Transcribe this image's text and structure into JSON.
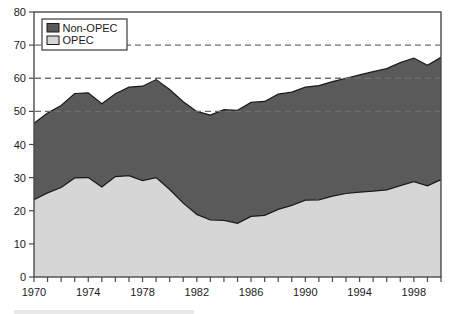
{
  "chart_data": {
    "type": "area",
    "title": "",
    "subtitle": "",
    "xlabel": "",
    "ylabel": "",
    "stacked": true,
    "grid": false,
    "legend_position": "top-left-inside",
    "xlim": [
      1970,
      2000
    ],
    "ylim": [
      0,
      80
    ],
    "yticks": [
      0,
      10,
      20,
      30,
      40,
      50,
      60,
      70,
      80
    ],
    "ytick_labels": [
      "0",
      "10",
      "20",
      "30",
      "40",
      "50",
      "60",
      "70",
      "80"
    ],
    "xticks": [
      1970,
      1971,
      1972,
      1973,
      1974,
      1975,
      1976,
      1977,
      1978,
      1979,
      1980,
      1981,
      1982,
      1983,
      1984,
      1985,
      1986,
      1987,
      1988,
      1989,
      1990,
      1991,
      1992,
      1993,
      1994,
      1995,
      1996,
      1997,
      1998,
      1999,
      2000
    ],
    "xtick_labels_shown": [
      "1970",
      "1974",
      "1978",
      "1982",
      "1986",
      "1990",
      "1994",
      "1998"
    ],
    "xtick_labels_shown_values": [
      1970,
      1974,
      1978,
      1982,
      1986,
      1990,
      1994,
      1998
    ],
    "x": [
      1970,
      1971,
      1972,
      1973,
      1974,
      1975,
      1976,
      1977,
      1978,
      1979,
      1980,
      1981,
      1982,
      1983,
      1984,
      1985,
      1986,
      1987,
      1988,
      1989,
      1990,
      1991,
      1992,
      1993,
      1994,
      1995,
      1996,
      1997,
      1998,
      1999,
      2000
    ],
    "series": [
      {
        "name": "OPEC",
        "color": "#d6d6d6",
        "values": [
          23.3,
          25.4,
          27.0,
          29.9,
          30.0,
          27.2,
          30.3,
          30.6,
          29.1,
          30.0,
          26.4,
          22.3,
          18.9,
          17.2,
          17.1,
          16.2,
          18.3,
          18.6,
          20.4,
          21.6,
          23.2,
          23.3,
          24.4,
          25.2,
          25.6,
          25.9,
          26.3,
          27.6,
          28.8,
          27.5,
          29.4
        ]
      },
      {
        "name": "Non-OPEC",
        "color": "#5a5a5a",
        "values": [
          23.1,
          24.1,
          24.8,
          25.5,
          25.6,
          25.1,
          25.0,
          26.7,
          28.5,
          29.6,
          30.2,
          30.6,
          31.1,
          31.7,
          33.4,
          34.1,
          34.4,
          34.4,
          34.8,
          34.2,
          34.1,
          34.5,
          34.6,
          34.8,
          35.4,
          36.1,
          36.6,
          37.1,
          37.3,
          36.4,
          36.9
        ]
      }
    ],
    "totals": [
      46.4,
      49.5,
      51.8,
      55.4,
      55.6,
      52.3,
      55.3,
      57.3,
      57.6,
      59.6,
      56.6,
      52.9,
      50.0,
      48.9,
      50.5,
      50.3,
      52.7,
      53.0,
      55.2,
      55.8,
      57.3,
      57.8,
      59.0,
      60.0,
      61.0,
      62.0,
      62.9,
      64.7,
      66.1,
      63.9,
      66.3
    ],
    "reference_lines": [
      {
        "value": 70,
        "style": "dashed",
        "color": "#6e6e6e"
      },
      {
        "value": 60,
        "style": "dashed",
        "color": "#6e6e6e"
      },
      {
        "value": 50,
        "style": "dashed",
        "color": "#6e6e6e"
      }
    ],
    "legend": [
      {
        "label": "Non-OPEC",
        "color": "#5a5a5a"
      },
      {
        "label": "OPEC",
        "color": "#d6d6d6"
      }
    ]
  },
  "axes": {
    "ytick_0": "0",
    "ytick_1": "10",
    "ytick_2": "20",
    "ytick_3": "30",
    "ytick_4": "40",
    "ytick_5": "50",
    "ytick_6": "60",
    "ytick_7": "70",
    "ytick_8": "80",
    "xtick_0": "1970",
    "xtick_1": "1974",
    "xtick_2": "1978",
    "xtick_3": "1982",
    "xtick_4": "1986",
    "xtick_5": "1990",
    "xtick_6": "1994",
    "xtick_7": "1998"
  },
  "legend": {
    "item_0_label": "Non-OPEC",
    "item_1_label": "OPEC"
  },
  "colors": {
    "non_opec_fill": "#5a5a5a",
    "opec_fill": "#d6d6d6",
    "axis": "#4a4a4a",
    "dashed_line": "#6e6e6e",
    "series_outline": "#1a1a1a",
    "background": "#ffffff"
  }
}
